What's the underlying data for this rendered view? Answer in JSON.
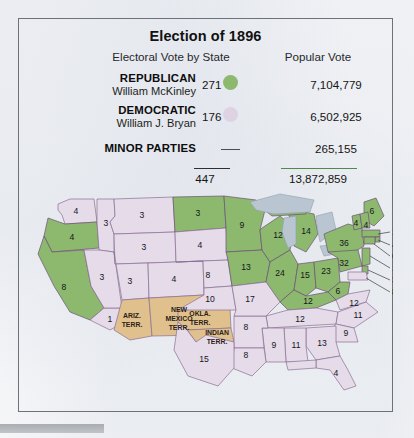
{
  "title": "Election of 1896",
  "columns": {
    "electoral": "Electoral Vote by State",
    "popular": "Popular Vote"
  },
  "colors": {
    "republican": "#8db96e",
    "democratic": "#ddd3e3",
    "territory": "#e0c08c",
    "water": "#b9c6d2",
    "frame": "#6d7278",
    "total_rule_popular": "#4e8a4c"
  },
  "parties": [
    {
      "party": "REPUBLICAN",
      "candidate": "William McKinley",
      "electoral": "271",
      "popular": "7,104,779",
      "swatch": "republican-swatch"
    },
    {
      "party": "DEMOCRATIC",
      "candidate": "William J. Bryan",
      "electoral": "176",
      "popular": "6,502,925",
      "swatch": "democratic-swatch"
    },
    {
      "party": "MINOR PARTIES",
      "candidate": "",
      "electoral": "—",
      "popular": "265,155",
      "swatch": "none-swatch"
    }
  ],
  "totals": {
    "electoral": "447",
    "popular": "13,872,859"
  },
  "map": {
    "territory_labels": [
      {
        "name": "arizona-territory",
        "lines": [
          "ARIZ.",
          "TERR."
        ]
      },
      {
        "name": "new-mexico-territory",
        "lines": [
          "NEW",
          "MEXICO",
          "TERR."
        ]
      },
      {
        "name": "oklahoma-territory",
        "lines": [
          "OKLA.",
          "TERR."
        ]
      },
      {
        "name": "indian-territory",
        "lines": [
          "INDIAN",
          "TERR."
        ]
      }
    ],
    "state_votes": [
      {
        "state": "washington",
        "votes": "4",
        "party": "democratic"
      },
      {
        "state": "oregon",
        "votes": "4",
        "party": "republican"
      },
      {
        "state": "california-north",
        "votes": "8",
        "party": "republican"
      },
      {
        "state": "california-south",
        "votes": "1",
        "party": "democratic"
      },
      {
        "state": "idaho",
        "votes": "3",
        "party": "democratic"
      },
      {
        "state": "nevada",
        "votes": "3",
        "party": "democratic"
      },
      {
        "state": "montana",
        "votes": "3",
        "party": "democratic"
      },
      {
        "state": "wyoming",
        "votes": "3",
        "party": "democratic"
      },
      {
        "state": "utah",
        "votes": "3",
        "party": "democratic"
      },
      {
        "state": "colorado",
        "votes": "4",
        "party": "democratic"
      },
      {
        "state": "north-dakota",
        "votes": "3",
        "party": "republican"
      },
      {
        "state": "south-dakota",
        "votes": "4",
        "party": "democratic"
      },
      {
        "state": "nebraska",
        "votes": "8",
        "party": "democratic"
      },
      {
        "state": "kansas",
        "votes": "10",
        "party": "democratic"
      },
      {
        "state": "minnesota",
        "votes": "9",
        "party": "republican"
      },
      {
        "state": "iowa",
        "votes": "13",
        "party": "republican"
      },
      {
        "state": "wisconsin",
        "votes": "12",
        "party": "republican"
      },
      {
        "state": "michigan",
        "votes": "14",
        "party": "republican"
      },
      {
        "state": "illinois",
        "votes": "24",
        "party": "republican"
      },
      {
        "state": "indiana",
        "votes": "15",
        "party": "republican"
      },
      {
        "state": "ohio",
        "votes": "23",
        "party": "republican"
      },
      {
        "state": "missouri",
        "votes": "17",
        "party": "democratic"
      },
      {
        "state": "kentucky",
        "votes": "12",
        "party": "republican"
      },
      {
        "state": "west-virginia",
        "votes": "6",
        "party": "republican"
      },
      {
        "state": "tennessee",
        "votes": "12",
        "party": "democratic"
      },
      {
        "state": "virginia",
        "votes": "12",
        "party": "democratic"
      },
      {
        "state": "north-carolina",
        "votes": "11",
        "party": "democratic"
      },
      {
        "state": "south-carolina",
        "votes": "9",
        "party": "democratic"
      },
      {
        "state": "georgia",
        "votes": "13",
        "party": "democratic"
      },
      {
        "state": "alabama",
        "votes": "11",
        "party": "democratic"
      },
      {
        "state": "mississippi",
        "votes": "9",
        "party": "democratic"
      },
      {
        "state": "arkansas",
        "votes": "8",
        "party": "democratic"
      },
      {
        "state": "louisiana",
        "votes": "8",
        "party": "democratic"
      },
      {
        "state": "texas",
        "votes": "15",
        "party": "democratic"
      },
      {
        "state": "florida",
        "votes": "4",
        "party": "democratic"
      },
      {
        "state": "new-york",
        "votes": "36",
        "party": "republican"
      },
      {
        "state": "pennsylvania",
        "votes": "32",
        "party": "republican"
      },
      {
        "state": "maine",
        "votes": "6",
        "party": "republican"
      },
      {
        "state": "vermont",
        "votes": "4",
        "party": "republican"
      },
      {
        "state": "new-hampshire",
        "votes": "4",
        "party": "republican"
      }
    ],
    "leader_labels": [
      {
        "state": "massachusetts",
        "votes": "15"
      },
      {
        "state": "rhode-island",
        "votes": "4"
      },
      {
        "state": "connecticut",
        "votes": "6"
      },
      {
        "state": "new-jersey",
        "votes": "10"
      },
      {
        "state": "delaware",
        "votes": "3"
      },
      {
        "state": "maryland",
        "votes": "8"
      }
    ]
  }
}
